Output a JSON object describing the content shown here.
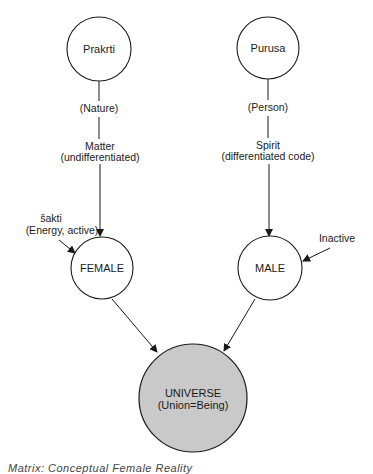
{
  "diagram": {
    "nodes": [
      {
        "id": "prakrti",
        "label": "Prakrti",
        "cx": 99,
        "cy": 49,
        "r": 32,
        "fill": "#ffffff"
      },
      {
        "id": "purusa",
        "label": "Purusa",
        "cx": 268,
        "cy": 48,
        "r": 31,
        "fill": "#ffffff"
      },
      {
        "id": "female",
        "label": "FEMALE",
        "cx": 102,
        "cy": 268,
        "r": 31,
        "fill": "#ffffff"
      },
      {
        "id": "male",
        "label": "MALE",
        "cx": 270,
        "cy": 268,
        "r": 32,
        "fill": "#ffffff"
      },
      {
        "id": "universe",
        "label": "UNIVERSE",
        "sublabel": "(Union=Being)",
        "cx": 193,
        "cy": 398,
        "r": 54,
        "fill": "#c9c9c9"
      }
    ],
    "left_chain": {
      "nature": "(Nature)",
      "matter": "Matter",
      "matter_sub": "(undifferentiated)"
    },
    "right_chain": {
      "person": "(Person)",
      "spirit": "Spirit",
      "spirit_sub": "(differentiated  code)"
    },
    "side_inputs": {
      "sakti": "šakti",
      "sakti_sub": "(Energy,  active)",
      "inactive": "Inactive"
    },
    "edges": [
      {
        "from": "prakrti",
        "to": "female",
        "label": "(Nature) → Matter (undifferentiated)"
      },
      {
        "from": "purusa",
        "to": "male",
        "label": "(Person) → Spirit (differentiated code)"
      },
      {
        "from": "sakti",
        "to": "female"
      },
      {
        "from": "inactive",
        "to": "male"
      },
      {
        "from": "female",
        "to": "universe"
      },
      {
        "from": "male",
        "to": "universe"
      }
    ],
    "colors": {
      "stroke": "#1a1a1a",
      "universe_fill": "#c9c9c9",
      "background": "#ffffff"
    }
  },
  "caption": "Matrix: Conceptual Female Reality"
}
